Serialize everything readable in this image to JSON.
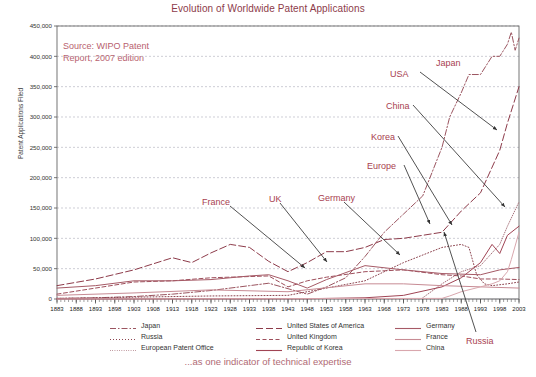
{
  "chart_data": {
    "type": "line",
    "title": "Evolution of Worldwide Patent Applications",
    "xlabel": "",
    "ylabel": "Patent Applications Filed",
    "ylim": [
      0,
      450000
    ],
    "xlim": [
      1883,
      2003
    ],
    "ytick_labels": [
      "0",
      "50,000",
      "100,000",
      "150,000",
      "200,000",
      "250,000",
      "300,000",
      "350,000",
      "400,000",
      "450,000"
    ],
    "ytick_values": [
      0,
      50000,
      100000,
      150000,
      200000,
      250000,
      300000,
      350000,
      400000,
      450000
    ],
    "xtick_labels": [
      "1883",
      "1888",
      "1893",
      "1898",
      "1903",
      "1908",
      "1913",
      "1918",
      "1923",
      "1928",
      "1933",
      "1938",
      "1943",
      "1948",
      "1953",
      "1958",
      "1963",
      "1968",
      "1973",
      "1978",
      "1983",
      "1988",
      "1993",
      "1998",
      "2003"
    ],
    "grid": "horizontal-dashed",
    "legend_position": "bottom",
    "source_note": "Source: WIPO Patent\nReport, 2007 edition",
    "caption": "...as one indicator of technical expertise",
    "series": [
      {
        "name": "Japan",
        "color": "#9b5560",
        "dash": "dash-dot",
        "x": [
          1883,
          1893,
          1903,
          1913,
          1923,
          1933,
          1938,
          1948,
          1953,
          1958,
          1963,
          1968,
          1973,
          1978,
          1983,
          1985,
          1988,
          1990,
          1993,
          1996,
          1998,
          2000,
          2001,
          2002,
          2003
        ],
        "values": [
          1000,
          2000,
          4000,
          8000,
          14000,
          22000,
          26000,
          8000,
          20000,
          35000,
          70000,
          110000,
          140000,
          170000,
          250000,
          300000,
          340000,
          370000,
          370000,
          400000,
          400000,
          420000,
          440000,
          410000,
          430000
        ]
      },
      {
        "name": "Russia",
        "color": "#8d4550",
        "dash": "dotted",
        "x": [
          1883,
          1903,
          1923,
          1943,
          1963,
          1973,
          1983,
          1988,
          1990,
          1992,
          1994,
          1996,
          2000,
          2003
        ],
        "values": [
          1000,
          3000,
          5000,
          6000,
          30000,
          60000,
          85000,
          90000,
          85000,
          40000,
          25000,
          22000,
          25000,
          28000
        ]
      },
      {
        "name": "European Patent Office",
        "color": "#a8737c",
        "dash": "fine-dotted",
        "x": [
          1978,
          1983,
          1988,
          1993,
          1998,
          2000,
          2003
        ],
        "values": [
          2000,
          25000,
          45000,
          55000,
          90000,
          120000,
          160000
        ]
      },
      {
        "name": "United States of America",
        "color": "#8d3b4a",
        "dash": "long-dash",
        "x": [
          1883,
          1893,
          1903,
          1913,
          1918,
          1923,
          1928,
          1933,
          1938,
          1943,
          1948,
          1953,
          1958,
          1963,
          1968,
          1973,
          1978,
          1983,
          1988,
          1993,
          1998,
          2000,
          2003
        ],
        "values": [
          22000,
          33000,
          48000,
          68000,
          60000,
          76000,
          90000,
          85000,
          62000,
          45000,
          60000,
          78000,
          78000,
          85000,
          98000,
          100000,
          105000,
          110000,
          145000,
          175000,
          245000,
          290000,
          350000
        ]
      },
      {
        "name": "United Kingdom",
        "color": "#9e4f5c",
        "dash": "medium-dash",
        "x": [
          1883,
          1893,
          1903,
          1913,
          1923,
          1933,
          1938,
          1943,
          1948,
          1953,
          1963,
          1973,
          1983,
          1988,
          1993,
          1998,
          2003
        ],
        "values": [
          8000,
          18000,
          28000,
          30000,
          35000,
          37000,
          38000,
          20000,
          30000,
          36000,
          45000,
          48000,
          40000,
          38000,
          33000,
          33000,
          32000
        ]
      },
      {
        "name": "Republic of Korea",
        "color": "#a04454",
        "dash": "solid",
        "x": [
          1883,
          1948,
          1963,
          1973,
          1983,
          1988,
          1993,
          1996,
          1998,
          2000,
          2003
        ],
        "values": [
          0,
          500,
          2000,
          6000,
          20000,
          35000,
          60000,
          90000,
          75000,
          105000,
          120000
        ]
      },
      {
        "name": "Germany",
        "color": "#a65a66",
        "dash": "solid",
        "x": [
          1883,
          1893,
          1903,
          1913,
          1923,
          1933,
          1938,
          1943,
          1948,
          1953,
          1963,
          1973,
          1983,
          1993,
          1998,
          2003
        ],
        "values": [
          18000,
          22000,
          30000,
          30000,
          32000,
          38000,
          40000,
          30000,
          18000,
          32000,
          55000,
          48000,
          42000,
          40000,
          48000,
          52000
        ]
      },
      {
        "name": "France",
        "color": "#c78b94",
        "dash": "solid",
        "x": [
          1883,
          1903,
          1923,
          1943,
          1963,
          1973,
          1983,
          1993,
          2003
        ],
        "values": [
          6000,
          10000,
          15000,
          12000,
          25000,
          25000,
          22000,
          20000,
          18000
        ]
      },
      {
        "name": "China",
        "color": "#d9a7ae",
        "dash": "solid",
        "x": [
          1883,
          1983,
          1985,
          1988,
          1993,
          1996,
          1998,
          2000,
          2001,
          2003
        ],
        "values": [
          0,
          1000,
          5000,
          12000,
          20000,
          25000,
          30000,
          45000,
          65000,
          110000
        ]
      }
    ],
    "annotations": [
      {
        "label": "Japan",
        "x": 436,
        "y": 58
      },
      {
        "label": "USA",
        "x": 390,
        "y": 69
      },
      {
        "label": "China",
        "x": 386,
        "y": 101
      },
      {
        "label": "Korea",
        "x": 371,
        "y": 132
      },
      {
        "label": "Europe",
        "x": 367,
        "y": 161
      },
      {
        "label": "France",
        "x": 202,
        "y": 197
      },
      {
        "label": "UK",
        "x": 269,
        "y": 194
      },
      {
        "label": "Germany",
        "x": 318,
        "y": 193
      },
      {
        "label": "Russia",
        "x": 466,
        "y": 336
      }
    ]
  },
  "legend": {
    "columns": [
      {
        "items": [
          {
            "label": "Japan",
            "key": "dash-dot"
          },
          {
            "label": "Russia",
            "key": "dotted"
          },
          {
            "label": "European Patent Office",
            "key": "fine-dotted"
          }
        ]
      },
      {
        "items": [
          {
            "label": "United States of America",
            "key": "long-dash"
          },
          {
            "label": "United Kingdom",
            "key": "medium-dash"
          },
          {
            "label": "Republic of Korea",
            "key": "solid"
          }
        ]
      },
      {
        "items": [
          {
            "label": "Germany",
            "key": "solid"
          },
          {
            "label": "France",
            "key": "solid"
          },
          {
            "label": "China",
            "key": "solid"
          }
        ]
      }
    ]
  },
  "colors": {
    "title": "#8d3b4a",
    "accent": "#a8414f",
    "caption": "#b06a74",
    "grid": "#b9b9c4",
    "axis": "#555555"
  }
}
